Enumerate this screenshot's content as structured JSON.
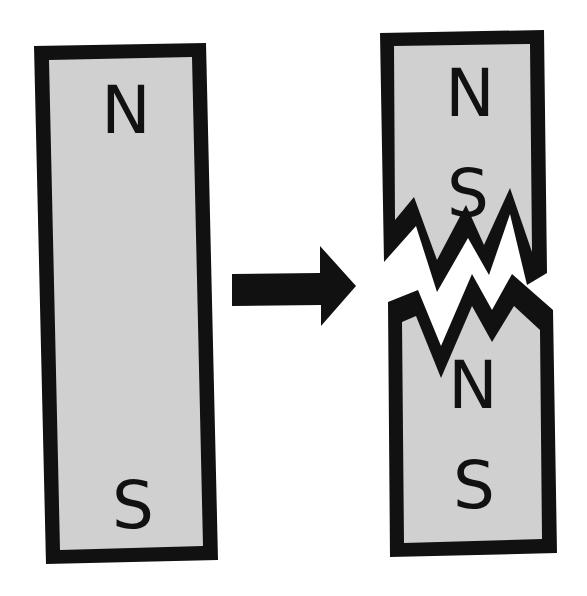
{
  "diagram": {
    "colors": {
      "magnet_fill": "#d0d0d0",
      "outline": "#111111",
      "background": "#ffffff"
    },
    "original_magnet": {
      "north_label": "N",
      "south_label": "S"
    },
    "arrow": {
      "direction": "right"
    },
    "broken_magnet": {
      "top_piece": {
        "north_label": "N",
        "south_label": "S"
      },
      "bottom_piece": {
        "north_label": "N",
        "south_label": "S"
      }
    }
  }
}
